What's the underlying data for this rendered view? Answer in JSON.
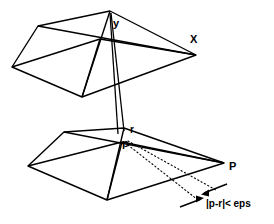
{
  "figure": {
    "labels": {
      "y_apex": "y",
      "x_vertex": "X",
      "r_point": "r",
      "p_point": "p",
      "P_vertex": "P",
      "epsilon_annotation": "|p-r|< eps"
    },
    "colors": {
      "stroke": "#000000",
      "background": "#ffffff",
      "dotted": "#000000"
    },
    "geometry": {
      "top_polygon": {
        "name": "upper-surface",
        "vertices": [
          [
            12,
            67
          ],
          [
            38,
            26
          ],
          [
            110,
            11
          ],
          [
            196,
            55
          ],
          [
            82,
            97
          ]
        ],
        "interior_vertex": [
          100,
          39
        ],
        "internal_edges": [
          [
            [
              12,
              67
            ],
            [
              100,
              39
            ]
          ],
          [
            [
              38,
              26
            ],
            [
              196,
              55
            ]
          ],
          [
            [
              110,
              11
            ],
            [
              82,
              97
            ]
          ],
          [
            [
              100,
              39
            ],
            [
              196,
              55
            ]
          ],
          [
            [
              100,
              39
            ],
            [
              82,
              97
            ]
          ]
        ]
      },
      "bottom_polygon": {
        "name": "lower-surface",
        "vertices": [
          [
            28,
            166
          ],
          [
            64,
            132
          ],
          [
            124,
            128
          ],
          [
            224,
            163
          ],
          [
            107,
            200
          ]
        ],
        "interior_vertex": [
          122,
          142
        ],
        "internal_edges": [
          [
            [
              28,
              166
            ],
            [
              122,
              142
            ]
          ],
          [
            [
              64,
              132
            ],
            [
              224,
              163
            ]
          ],
          [
            [
              124,
              128
            ],
            [
              107,
              200
            ]
          ],
          [
            [
              122,
              142
            ],
            [
              224,
              163
            ]
          ],
          [
            [
              122,
              142
            ],
            [
              107,
              200
            ]
          ]
        ]
      },
      "vertical_connector": {
        "name": "y-to-p-projector",
        "apex": [
          110,
          11
        ],
        "left_foot": [
          118,
          133
        ],
        "right_foot": [
          124,
          131
        ]
      },
      "dotted_leaders": [
        {
          "from": [
            126,
            142
          ],
          "to": [
            214,
            191
          ]
        },
        {
          "from": [
            126,
            145
          ],
          "to": [
            197,
            199
          ]
        }
      ],
      "measure_arrows": [
        {
          "from": [
            224,
            186
          ],
          "to": [
            199,
            196
          ],
          "head": "end"
        },
        {
          "from": [
            183,
            205
          ],
          "to": [
            206,
            196
          ],
          "head": "end"
        }
      ]
    }
  }
}
